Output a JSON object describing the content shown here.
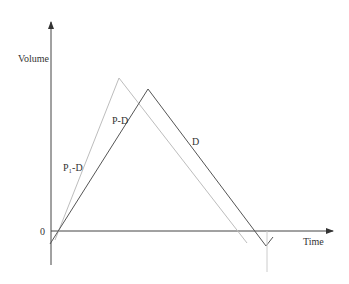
{
  "diagram": {
    "type": "line-diagram",
    "axes": {
      "y_label": "Volume",
      "x_label": "Time",
      "origin_label": "0"
    },
    "series": [
      {
        "name": "P-D",
        "label": "P-D",
        "color": "#bdbdbd",
        "points": [
          [
            55,
            240
          ],
          [
            119,
            78
          ],
          [
            247,
            243
          ]
        ]
      },
      {
        "name": "D",
        "label": "D",
        "color": "#555555",
        "points": [
          [
            50,
            244
          ],
          [
            148,
            89
          ],
          [
            266,
            246
          ],
          [
            273,
            237
          ]
        ]
      }
    ],
    "labels": {
      "p1_d": "P₁-D",
      "p_d": "P-D",
      "d": "D"
    },
    "colors": {
      "axis": "#444444",
      "dark_line": "#555555",
      "light_line": "#bdbdbd",
      "marker_line": "#cccccc"
    }
  }
}
